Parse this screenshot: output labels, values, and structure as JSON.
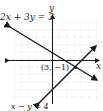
{
  "figure": {
    "equation_1": "2x + 3y = 3",
    "equation_2": "x − y = 4",
    "intersection_label": "(3, −1)",
    "x_axis_label": "x",
    "y_axis_label": "y",
    "colors": {
      "line": "#1a1a1a",
      "grid": "#bdbdbd"
    }
  }
}
